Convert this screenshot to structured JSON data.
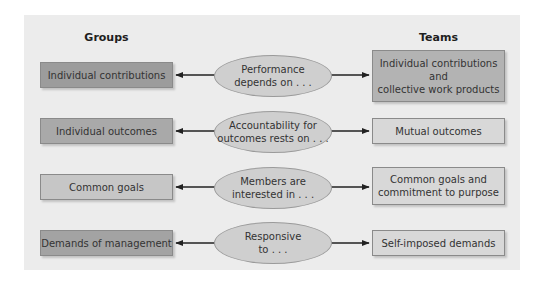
{
  "headings": {
    "left": "Groups",
    "right": "Teams"
  },
  "colors": {
    "panel_background": "#ececec",
    "ellipse_fill": "#cfcfcf",
    "arrow": "#222222"
  },
  "rows": [
    {
      "group": {
        "label": "Individual contributions",
        "fill": "#9c9c9c"
      },
      "connector": {
        "label": "Performance\ndepends on . . ."
      },
      "team": {
        "label": "Individual contributions\nand\ncollective work products",
        "fill": "#b3b3b3"
      }
    },
    {
      "group": {
        "label": "Individual outcomes",
        "fill": "#a9a9a9"
      },
      "connector": {
        "label": "Accountability for\noutcomes rests on . . ."
      },
      "team": {
        "label": "Mutual outcomes",
        "fill": "#d8d8d8"
      }
    },
    {
      "group": {
        "label": "Common goals",
        "fill": "#c6c6c6"
      },
      "connector": {
        "label": "Members are\ninterested in . . ."
      },
      "team": {
        "label": "Common goals and\ncommitment to purpose",
        "fill": "#d8d8d8"
      }
    },
    {
      "group": {
        "label": "Demands of management",
        "fill": "#a3a3a3"
      },
      "connector": {
        "label": "Responsive\nto . . ."
      },
      "team": {
        "label": "Self-imposed demands",
        "fill": "#d8d8d8"
      }
    }
  ]
}
